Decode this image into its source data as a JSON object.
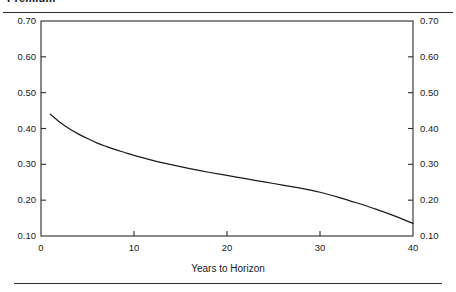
{
  "figure": {
    "title": "Premium",
    "title_clipped": true
  },
  "chart_data": {
    "type": "line",
    "title": "Premium",
    "xlabel": "Years to Horizon",
    "ylabel": "",
    "xlim": [
      0,
      40
    ],
    "ylim": [
      0.1,
      0.7
    ],
    "grid": false,
    "legend": null,
    "x_ticks": [
      "0",
      "10",
      "20",
      "30",
      "40"
    ],
    "x_tick_values": [
      0,
      10,
      20,
      30,
      40
    ],
    "y_ticks": [
      "0.10",
      "0.20",
      "0.30",
      "0.40",
      "0.50",
      "0.60",
      "0.70"
    ],
    "y_tick_values": [
      0.1,
      0.2,
      0.3,
      0.4,
      0.5,
      0.6,
      0.7
    ],
    "y_axis_right_mirrored": true,
    "series": [
      {
        "name": "Premium",
        "color": "#1a1a1a",
        "x": [
          1,
          2,
          3,
          4,
          5,
          6,
          7,
          8,
          9,
          10,
          12,
          14,
          16,
          18,
          20,
          22,
          24,
          26,
          28,
          30,
          32,
          34,
          36,
          38,
          40
        ],
        "values": [
          0.44,
          0.418,
          0.4,
          0.385,
          0.372,
          0.36,
          0.35,
          0.341,
          0.333,
          0.325,
          0.311,
          0.299,
          0.288,
          0.278,
          0.269,
          0.26,
          0.251,
          0.242,
          0.233,
          0.222,
          0.208,
          0.192,
          0.175,
          0.156,
          0.135
        ]
      }
    ]
  },
  "axes": {
    "x_title": "Years to Horizon"
  }
}
